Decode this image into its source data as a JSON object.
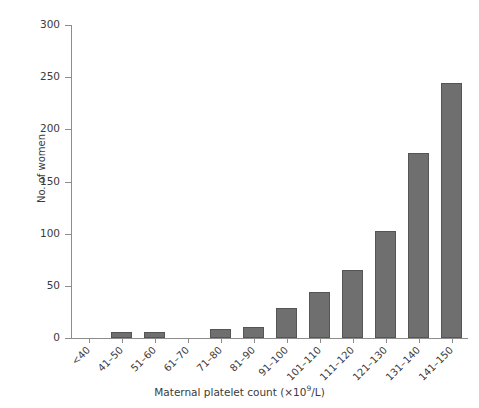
{
  "chart_data": {
    "type": "bar",
    "title": "",
    "subtitle": "",
    "xlabel": "Maternal platelet count (×10⁹/L)",
    "ylabel": "No. of women",
    "categories": [
      "<40",
      "41–50",
      "51–60",
      "61–70",
      "71–80",
      "81–90",
      "91–100",
      "101–110",
      "111–120",
      "121–130",
      "131–140",
      "141–150"
    ],
    "values": [
      0,
      6,
      6,
      0,
      9,
      11,
      29,
      44,
      65,
      103,
      177,
      244
    ],
    "ylim": [
      0,
      300
    ],
    "yticks": [
      0,
      50,
      100,
      150,
      200,
      250,
      300
    ],
    "ytick_labels": [
      "0",
      "50",
      "100",
      "150",
      "200",
      "250",
      "300"
    ],
    "grid": false,
    "legend": false,
    "bar_color": "#6f6f6f",
    "bar_edge_color": "#555555",
    "axis_color": "#8d8d8d",
    "text_color": "#3b3b3b",
    "background": "#ffffff"
  },
  "axis_title_parts": {
    "x_title_main": "Maternal platelet count (×10",
    "x_title_sup": "9",
    "x_title_tail": "/L)"
  }
}
